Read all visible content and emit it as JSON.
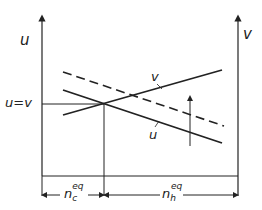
{
  "diagram": {
    "left_axis_label": "u",
    "right_axis_label": "v",
    "equality_label": "u=v",
    "curve_v_label": "v",
    "curve_u_label": "u",
    "dim_left": {
      "main": "n",
      "sub": "c",
      "sup": "eq"
    },
    "dim_right": {
      "main": "n",
      "sub": "h",
      "sup": "eq"
    },
    "stroke_color": "#222222"
  }
}
